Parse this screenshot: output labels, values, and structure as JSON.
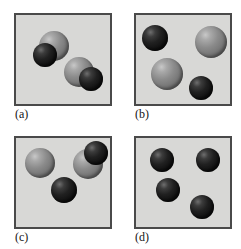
{
  "figure": {
    "background_color": "#ffffff",
    "panel_fill_color": "#d8d8d6",
    "panel_border_color": "#4a4a4a",
    "atom_colors": {
      "dark": "#141414",
      "light": "#8b8b8b"
    },
    "panels": [
      {
        "id": "a",
        "label": "(a)",
        "box": {
          "x": 14,
          "y": 13,
          "w": 98,
          "h": 93
        },
        "label_pos": {
          "x": 15,
          "y": 108
        },
        "description": "Two diatomic molecules, each one light atom bonded to one dark atom",
        "atoms": [
          {
            "name": "atom-a1-light",
            "kind": "light",
            "cx": 54,
            "cy": 46,
            "r": 15
          },
          {
            "name": "atom-a1-dark",
            "kind": "dark",
            "cx": 45,
            "cy": 55,
            "r": 12
          },
          {
            "name": "atom-a2-light",
            "kind": "light",
            "cx": 79,
            "cy": 72,
            "r": 15
          },
          {
            "name": "atom-a2-dark",
            "kind": "dark",
            "cx": 91,
            "cy": 79,
            "r": 12
          }
        ]
      },
      {
        "id": "b",
        "label": "(b)",
        "box": {
          "x": 134,
          "y": 13,
          "w": 98,
          "h": 93
        },
        "label_pos": {
          "x": 135,
          "y": 108
        },
        "description": "Four separate unbonded atoms, two dark and two light",
        "atoms": [
          {
            "name": "atom-b1-dark",
            "kind": "dark",
            "cx": 155,
            "cy": 38,
            "r": 13
          },
          {
            "name": "atom-b2-light",
            "kind": "light",
            "cx": 211,
            "cy": 42,
            "r": 16
          },
          {
            "name": "atom-b3-light",
            "kind": "light",
            "cx": 167,
            "cy": 74,
            "r": 16
          },
          {
            "name": "atom-b4-dark",
            "kind": "dark",
            "cx": 201,
            "cy": 88,
            "r": 12
          }
        ]
      },
      {
        "id": "c",
        "label": "(c)",
        "box": {
          "x": 14,
          "y": 136,
          "w": 98,
          "h": 93
        },
        "label_pos": {
          "x": 15,
          "y": 231
        },
        "description": "One free light atom, one diatomic light-dark molecule, and one free dark atom",
        "atoms": [
          {
            "name": "atom-c1-light",
            "kind": "light",
            "cx": 40,
            "cy": 163,
            "r": 15
          },
          {
            "name": "atom-c2-light",
            "kind": "light",
            "cx": 88,
            "cy": 164,
            "r": 15
          },
          {
            "name": "atom-c2-dark",
            "kind": "dark",
            "cx": 96,
            "cy": 153,
            "r": 12
          },
          {
            "name": "atom-c3-dark",
            "kind": "dark",
            "cx": 64,
            "cy": 190,
            "r": 13
          }
        ]
      },
      {
        "id": "d",
        "label": "(d)",
        "box": {
          "x": 134,
          "y": 136,
          "w": 98,
          "h": 93
        },
        "label_pos": {
          "x": 135,
          "y": 231
        },
        "description": "Four separate unbonded dark atoms",
        "atoms": [
          {
            "name": "atom-d1-dark",
            "kind": "dark",
            "cx": 162,
            "cy": 160,
            "r": 12
          },
          {
            "name": "atom-d2-dark",
            "kind": "dark",
            "cx": 208,
            "cy": 160,
            "r": 12
          },
          {
            "name": "atom-d3-dark",
            "kind": "dark",
            "cx": 168,
            "cy": 190,
            "r": 12
          },
          {
            "name": "atom-d4-dark",
            "kind": "dark",
            "cx": 202,
            "cy": 207,
            "r": 12
          }
        ]
      }
    ]
  }
}
